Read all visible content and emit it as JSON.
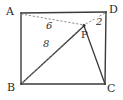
{
  "figure": {
    "canvas": {
      "width": 123,
      "height": 100
    },
    "stroke_color": "#3a3a3a",
    "dashed_color": "#8c8c8c",
    "label_color": "#2b2b2b",
    "background": "#ffffff"
  },
  "vertices": [
    {
      "id": "A",
      "label": "A",
      "x": 21,
      "y": 13,
      "label_x": 6,
      "label_y": 6
    },
    {
      "id": "D",
      "label": "D",
      "x": 106,
      "y": 12,
      "label_x": 109,
      "label_y": 4
    },
    {
      "id": "B",
      "label": "B",
      "x": 21,
      "y": 84,
      "label_x": 7,
      "label_y": 82
    },
    {
      "id": "C",
      "label": "C",
      "x": 105,
      "y": 84,
      "label_x": 107,
      "label_y": 83
    }
  ],
  "interior_point": {
    "id": "P",
    "label": "P",
    "x": 84,
    "y": 26,
    "label_x": 81,
    "label_y": 30
  },
  "edges": [
    {
      "id": "AD",
      "from": "A",
      "to": "D",
      "style": "solid"
    },
    {
      "id": "AB",
      "from": "A",
      "to": "B",
      "style": "solid"
    },
    {
      "id": "BC",
      "from": "B",
      "to": "C",
      "style": "solid"
    },
    {
      "id": "CD",
      "from": "C",
      "to": "D",
      "style": "solid"
    }
  ],
  "segments": [
    {
      "id": "AP",
      "from": "A",
      "to": "P",
      "style": "dashed",
      "measure": "6"
    },
    {
      "id": "BP-dashed",
      "from": "B",
      "to": "P",
      "style": "dashed",
      "measure": "8"
    },
    {
      "id": "DP",
      "from": "D",
      "to": "P",
      "style": "dashed",
      "measure": "2"
    },
    {
      "id": "BP-solid",
      "from": "B",
      "to": "P",
      "style": "solid",
      "measure": ""
    },
    {
      "id": "PC",
      "from": "P",
      "to": "C",
      "style": "solid",
      "measure": ""
    }
  ],
  "measures": [
    {
      "id": "AP-measure",
      "text": "6",
      "x": 45,
      "y": 21
    },
    {
      "id": "BP-measure",
      "text": "8",
      "x": 42,
      "y": 39
    },
    {
      "id": "DP-measure",
      "text": "2",
      "x": 95,
      "y": 17
    }
  ]
}
